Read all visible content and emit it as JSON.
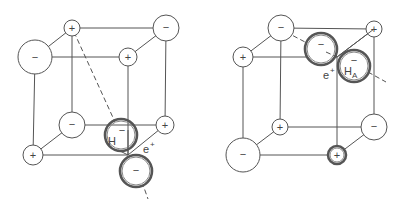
{
  "diagram": {
    "type": "crystal-lattice-defect",
    "panels": [
      {
        "id": "left",
        "labels": {
          "hydrogen": "H",
          "hydrogen_charge": "−",
          "positron": "e",
          "positron_charge": "+"
        },
        "ions": [
          {
            "pos": "top-back-left",
            "sign": "+",
            "cx": 72,
            "cy": 28,
            "r": 8
          },
          {
            "pos": "top-front-left",
            "sign": "−",
            "cx": 35,
            "cy": 57,
            "r": 17
          },
          {
            "pos": "top-back-right",
            "sign": "−",
            "cx": 166,
            "cy": 28,
            "r": 13
          },
          {
            "pos": "top-front-right",
            "sign": "+",
            "cx": 128,
            "cy": 57,
            "r": 9
          },
          {
            "pos": "bottom-back-left",
            "sign": "−",
            "cx": 72,
            "cy": 125,
            "r": 13
          },
          {
            "pos": "bottom-front-left",
            "sign": "+",
            "cx": 33,
            "cy": 155,
            "r": 10
          },
          {
            "pos": "bottom-back-right",
            "sign": "+",
            "cx": 165,
            "cy": 125,
            "r": 9
          }
        ],
        "special_ions": [
          {
            "name": "H-minus",
            "sign": "−",
            "cx": 121,
            "cy": 135,
            "r": 16
          },
          {
            "name": "displaced-anion",
            "sign": "−",
            "cx": 136,
            "cy": 171,
            "r": 16
          }
        ]
      },
      {
        "id": "right",
        "labels": {
          "hydrogen": "H",
          "hydrogen_sub": "A",
          "hydrogen_charge": "−",
          "positron": "e",
          "positron_charge": "+"
        },
        "ions": [
          {
            "pos": "top-back-left",
            "sign": "−",
            "cx": 281,
            "cy": 28,
            "r": 13
          },
          {
            "pos": "top-front-left",
            "sign": "+",
            "cx": 243,
            "cy": 57,
            "r": 10
          },
          {
            "pos": "top-back-right",
            "sign": "+",
            "cx": 374,
            "cy": 29,
            "r": 8
          },
          {
            "pos": "bottom-back-left",
            "sign": "+",
            "cx": 280,
            "cy": 127,
            "r": 8
          },
          {
            "pos": "bottom-front-left",
            "sign": "−",
            "cx": 243,
            "cy": 155,
            "r": 17
          },
          {
            "pos": "bottom-back-right",
            "sign": "−",
            "cx": 374,
            "cy": 127,
            "r": 13
          }
        ],
        "special_ions": [
          {
            "name": "displaced-anion",
            "sign": "−",
            "cx": 321,
            "cy": 49,
            "r": 16
          },
          {
            "name": "H-A",
            "sign": "−",
            "cx": 354,
            "cy": 66,
            "r": 16
          },
          {
            "name": "bottom-front-right-cation",
            "sign": "+",
            "cx": 337,
            "cy": 155,
            "r": 9
          }
        ]
      }
    ]
  }
}
